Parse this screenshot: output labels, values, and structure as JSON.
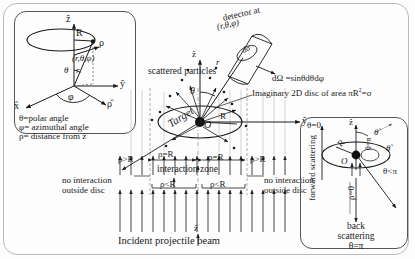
{
  "figure": {
    "bottom_caption": "Incident projectile beam"
  },
  "left_panel": {
    "name": "spherical-coordinates-inset",
    "axes": {
      "z": "ẑ",
      "y": "ŷ",
      "x": "x̂",
      "rho_hat": "ρ̂"
    },
    "radius_label": "R",
    "point_label": "(r,θ,φ)",
    "rho_label": "ρ",
    "theta_label": "θ",
    "r_label": "r",
    "phi_label": "φ",
    "legend": [
      "θ=polar angle",
      "φ= azimuthal angle",
      "ρ= distance from ẑ"
    ]
  },
  "center_panel": {
    "name": "scattering-diagram",
    "detector_label": "detector at",
    "detector_coords": "(r,θ,φ)",
    "solid_angle_label": "dΩ",
    "dsigma_label": "dσ",
    "scattered_particles": "scattered particles",
    "solid_angle_formula": "dΩ =sinθdθdφ",
    "imaginary_disc": "Imaginary 2D disc of area πR",
    "imaginary_disc_sup": "2",
    "imaginary_disc_tail": "=σ",
    "target_label": "Target",
    "origin_label": "O",
    "target_radius": "R",
    "axis_z": "ẑ",
    "axis_y": "ŷ",
    "theta_label": "θ",
    "r_label": "r",
    "rho_markers": [
      {
        "text": "ρ>R",
        "side": "left-outer"
      },
      {
        "text": "ρ=R",
        "side": "left-inner"
      },
      {
        "text": "ρ=R",
        "side": "right-inner"
      },
      {
        "text": "ρ>R",
        "side": "right-outer"
      }
    ],
    "interaction_zone": "interaction zone",
    "rho_less_left": "ρ<R",
    "rho_less_right": "ρ<R",
    "no_interaction_left": "no interaction\noutside disc",
    "no_interaction_left_l1": "no interaction",
    "no_interaction_left_l2": "outside disc",
    "no_interaction_right_l1": "no interaction",
    "no_interaction_right_l2": "outside disc"
  },
  "right_panel": {
    "name": "forward-back-scattering-inset",
    "forward_line1": "forward",
    "forward_line2": "scattering",
    "theta_zero": "θ=0",
    "axis_z": "ẑ",
    "theta_prime_outer": "θˋ",
    "theta_prime_inner": "θˋ",
    "theta_eq_pi": "θ=π",
    "theta_lt_pi": "θ<π",
    "rho_zero": "ρ=0",
    "radius_label": "R",
    "origin_label": "O",
    "back_line1": "back",
    "back_line2": "scattering",
    "back_theta": "θ=π"
  },
  "colors": {
    "ink": "#1a1a1a",
    "frame": "#b9b9b9",
    "panel_border": "#555555",
    "beam": "#222222",
    "dash": "#666666"
  }
}
